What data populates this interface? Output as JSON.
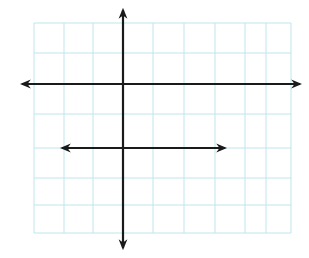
{
  "diagram": {
    "type": "coordinate-grid-lines",
    "colors": {
      "grid": "#bfe6ec",
      "line": "#1a1a1a",
      "background": "#ffffff"
    },
    "grid": {
      "left": 34,
      "top": 23,
      "right": 291,
      "bottom": 233,
      "cols": [
        34,
        64,
        93,
        123,
        153,
        184,
        215,
        245,
        266,
        291
      ],
      "rows": [
        23,
        53,
        84,
        114,
        148,
        178,
        205,
        233
      ]
    },
    "lines": [
      {
        "name": "x-axis",
        "x1": 22,
        "y1": 84,
        "x2": 300,
        "y2": 84,
        "arrows": "both"
      },
      {
        "name": "y-axis",
        "x1": 123,
        "y1": 10,
        "x2": 123,
        "y2": 248,
        "arrows": "both"
      },
      {
        "name": "parallel-line",
        "x1": 62,
        "y1": 148,
        "x2": 225,
        "y2": 148,
        "arrows": "both"
      }
    ]
  }
}
